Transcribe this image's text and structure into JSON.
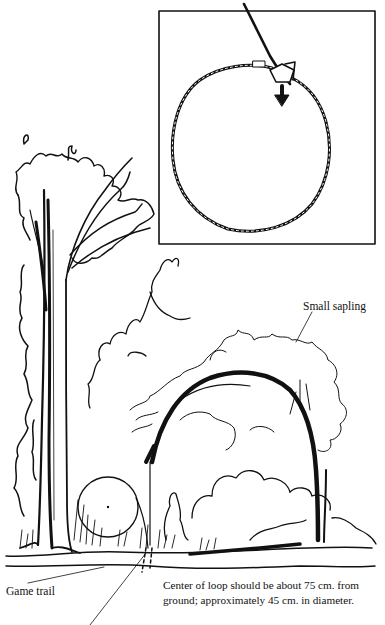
{
  "figure": {
    "inset": {
      "description": "Wire snare loop with lock and pull-direction arrow",
      "icons": [
        "snare-loop-icon",
        "lock-slider-icon",
        "arrow-down-icon"
      ]
    },
    "labels": {
      "sapling": "Small sapling",
      "game_trail": "Game trail"
    },
    "caption": {
      "line1": "Center of loop should be about 75 cm. from",
      "line2": "ground; approximately 45 cm. in diameter."
    },
    "colors": {
      "ink": "#111111",
      "paper": "#ffffff"
    }
  }
}
